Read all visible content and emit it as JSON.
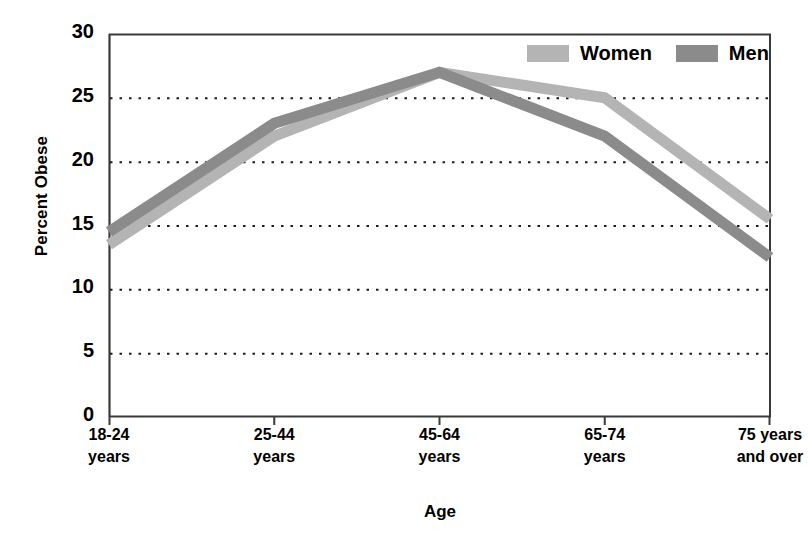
{
  "chart_data": {
    "type": "line",
    "title": "",
    "xlabel": "Age",
    "ylabel": "Percent Obese",
    "categories": [
      "18-24 years",
      "25-44 years",
      "45-64 years",
      "65-74 years",
      "75 years and over"
    ],
    "category_lines": [
      [
        "18-24",
        "years"
      ],
      [
        "25-44",
        "years"
      ],
      [
        "45-64",
        "years"
      ],
      [
        "65-74",
        "years"
      ],
      [
        "75 years",
        "and over"
      ]
    ],
    "series": [
      {
        "name": "Women",
        "color": "#b4b4b4",
        "values": [
          13.5,
          22.0,
          27.0,
          25.0,
          15.5
        ]
      },
      {
        "name": "Men",
        "color": "#8b8b8b",
        "values": [
          14.5,
          23.0,
          27.0,
          22.0,
          12.5
        ]
      }
    ],
    "ylim": [
      0,
      30
    ],
    "yticks": [
      0,
      5,
      10,
      15,
      20,
      25,
      30
    ],
    "ytick_labels": [
      "0",
      "5",
      "10",
      "15",
      "20",
      "25",
      "30"
    ],
    "grid": true,
    "grid_style": "dotted-horizontal",
    "legend_position": "top-right"
  },
  "legend": {
    "entries": [
      {
        "label": "Women"
      },
      {
        "label": "Men"
      }
    ]
  },
  "axes": {
    "y_title": "Percent Obese",
    "x_title": "Age"
  },
  "colors": {
    "women": "#b4b4b4",
    "men": "#8b8b8b",
    "axis": "#3a3a3a",
    "grid": "#1a1a1a",
    "text": "#000000",
    "background": "#ffffff"
  }
}
